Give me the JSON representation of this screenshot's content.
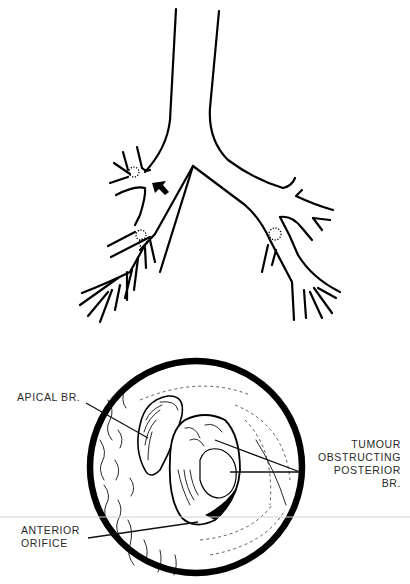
{
  "figure": {
    "top_panel": {
      "name": "bronchial-tree-schematic",
      "markers": {
        "arrow": "arrow-pointing-to-right-upper-lobe-bronchus",
        "dotted_circles": 4
      }
    },
    "bottom_panel": {
      "name": "bronchoscopic-view",
      "labels": {
        "apical": "APICAL BR.",
        "tumour_line1": "TUMOUR",
        "tumour_line2": "OBSTRUCTING",
        "tumour_line3": "POSTERIOR",
        "tumour_line4": "BR.",
        "anterior_line1": "ANTERIOR",
        "anterior_line2": "ORIFICE"
      }
    }
  },
  "colors": {
    "ink": "#000000",
    "label": "#2a2a2a",
    "background": "#ffffff",
    "scan_line": "#d0d0d0"
  }
}
